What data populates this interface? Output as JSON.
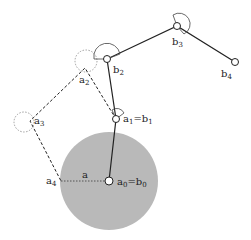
{
  "diagram": {
    "type": "kinematic-chain",
    "colors": {
      "disk": "#b8b8b8",
      "line": "#222222",
      "node_fill": "#ffffff",
      "dotted": "#666666"
    },
    "labels": {
      "a0b0": {
        "base": "a",
        "sub": "0",
        "eq": "=b",
        "sub2": "0"
      },
      "a1b1": {
        "base": "a",
        "sub": "1",
        "eq": "=b",
        "sub2": "1"
      },
      "a2": {
        "base": "a",
        "sub": "2"
      },
      "a3": {
        "base": "a",
        "sub": "3"
      },
      "a4": {
        "base": "a",
        "sub": "4"
      },
      "b2": {
        "base": "b",
        "sub": "2"
      },
      "b3": {
        "base": "b",
        "sub": "3"
      },
      "b4": {
        "base": "b",
        "sub": "4"
      },
      "radius": "a"
    }
  }
}
